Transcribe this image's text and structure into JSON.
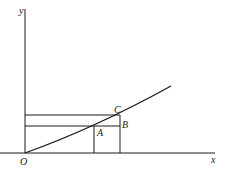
{
  "diagram": {
    "axes": {
      "x_label": "x",
      "y_label": "y",
      "origin_label": "O"
    },
    "points": {
      "A": "A",
      "B": "B",
      "C": "C"
    },
    "colors": {
      "line": "#1a1a1a",
      "background": "#ffffff"
    }
  }
}
